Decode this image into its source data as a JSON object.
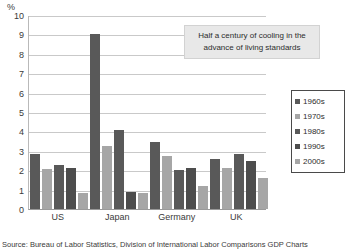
{
  "chart_data": {
    "type": "bar",
    "title": "",
    "xlabel": "",
    "ylabel": "%",
    "ylim": [
      0,
      10
    ],
    "ytick_step": 1,
    "grid": true,
    "legend_position": "right",
    "categories": [
      "US",
      "Japan",
      "Germany",
      "UK"
    ],
    "ytick_labels": [
      "10",
      "9",
      "8",
      "7",
      "6",
      "5",
      "4",
      "3",
      "2",
      "1",
      "0"
    ],
    "series": [
      {
        "name": "1960s",
        "color": "#595959",
        "values": [
          2.85,
          9.0,
          3.45,
          2.6
        ]
      },
      {
        "name": "1970s",
        "color": "#a6a6a6",
        "values": [
          2.05,
          3.25,
          2.75,
          2.1
        ]
      },
      {
        "name": "1980s",
        "color": "#595959",
        "values": [
          2.25,
          4.05,
          2.0,
          2.85
        ]
      },
      {
        "name": "1990s",
        "color": "#4d4d4d",
        "values": [
          2.1,
          0.9,
          2.1,
          2.45
        ]
      },
      {
        "name": "2000s",
        "color": "#a6a6a6",
        "values": [
          0.8,
          0.85,
          1.2,
          1.6
        ]
      }
    ],
    "annotation": "Half a century of cooling in the advance of living standards",
    "source": "Source: Bureau of Labor Statistics, Division of International Labor Comparisons GDP Charts"
  },
  "axis": {
    "unit_label": "%"
  },
  "annotation": {
    "line1": "Half a century of cooling in the",
    "line2": "advance of living standards"
  },
  "source": {
    "text": "Source: Bureau of Labor Statistics, Division of International Labor Comparisons GDP Charts"
  }
}
